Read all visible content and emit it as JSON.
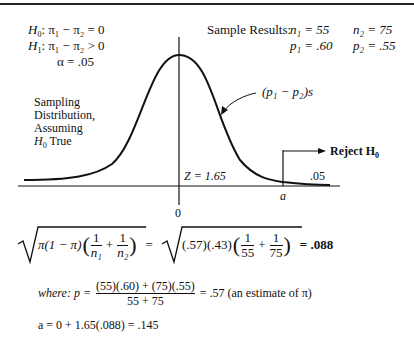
{
  "hypotheses": {
    "h0": {
      "label": "H",
      "sub": "0",
      "expr": ": π₁ − π₂ = 0"
    },
    "h1": {
      "label": "H",
      "sub": "1",
      "expr": ": π₁ − π₂ > 0"
    },
    "alpha": "α = .05"
  },
  "sample_results": {
    "label": "Sample Results:",
    "n1": "n₁ = 55",
    "n2": "n₂ = 75",
    "p1": "p₁ = .60",
    "p2": "p₂ = .55"
  },
  "diagram": {
    "curve_label": "(p₁ − p₂)s",
    "distribution_label": [
      "Sampling",
      "Distribution,",
      "Assuming"
    ],
    "h0_true": {
      "label": "H",
      "sub": "0",
      "text": "True"
    },
    "z_label": "Z = 1.65",
    "alpha_tail": ".05",
    "critical_label": "a",
    "zero_label": "0",
    "reject": {
      "label": "Reject H",
      "sub": "0"
    }
  },
  "formulas": {
    "std_error": {
      "lhs_prefix": "π(1 − π)",
      "lhs_frac1": {
        "num": "1",
        "den": "n₁"
      },
      "lhs_frac2": {
        "num": "1",
        "den": "n₂"
      },
      "equals": "=",
      "rhs_prefix": "(.57)(.43)",
      "rhs_frac1": {
        "num": "1",
        "den": "55"
      },
      "rhs_frac2": {
        "num": "1",
        "den": "75"
      },
      "result": "= .088"
    },
    "pooled": {
      "prefix": "where: p =",
      "num": "(55)(.60) + (75)(.55)",
      "den": "55 + 75",
      "result": "= .57 (an estimate of π)"
    },
    "critical": "a = 0 + 1.65(.088) = .145"
  }
}
